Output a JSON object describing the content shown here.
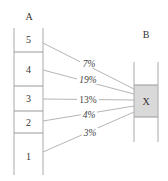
{
  "diagram": {
    "column_a": {
      "label": "A",
      "cells": [
        {
          "label": "5",
          "y_top": 28,
          "y_bottom": 52
        },
        {
          "label": "4",
          "y_top": 52,
          "y_bottom": 86
        },
        {
          "label": "3",
          "y_top": 86,
          "y_bottom": 111
        },
        {
          "label": "2",
          "y_top": 111,
          "y_bottom": 133
        },
        {
          "label": "1",
          "y_top": 133,
          "y_bottom": 175
        }
      ]
    },
    "column_b": {
      "label": "B",
      "target": {
        "label": "X",
        "fill": "#d9d9d9"
      }
    },
    "flows": [
      {
        "from": "5",
        "to": "X",
        "value": "7%",
        "italic": true
      },
      {
        "from": "4",
        "to": "X",
        "value": "19%",
        "italic": true
      },
      {
        "from": "3",
        "to": "X",
        "value": "13%",
        "italic": false
      },
      {
        "from": "2",
        "to": "X",
        "value": "4%",
        "italic": true
      },
      {
        "from": "1",
        "to": "X",
        "value": "3%",
        "italic": true
      }
    ],
    "colors": {
      "line": "#b5b5b5",
      "border": "#999999",
      "text": "#333333",
      "box_fill": "#d9d9d9"
    }
  }
}
